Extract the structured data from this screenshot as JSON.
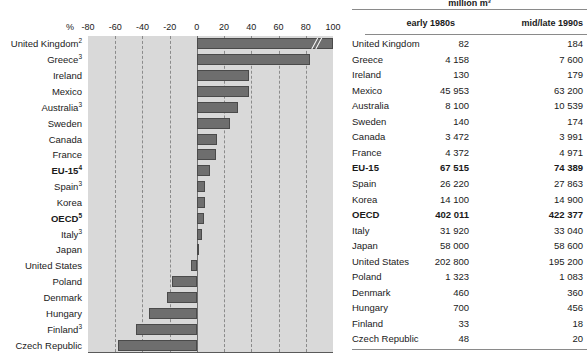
{
  "chart_data": {
    "type": "bar",
    "orientation": "horizontal",
    "title": "",
    "xlabel": "%",
    "ylabel": "",
    "xlim": [
      -80,
      100
    ],
    "grid": true,
    "legend": "none",
    "unit_label": "%",
    "tick_labels": [
      "-80",
      "-60",
      "-40",
      "-20",
      "0",
      "20",
      "40",
      "60",
      "80",
      "100"
    ],
    "ticks": [
      -80,
      -60,
      -40,
      -20,
      0,
      20,
      40,
      60,
      80,
      100
    ],
    "categories": [
      "United Kingdom",
      "Greece",
      "Ireland",
      "Mexico",
      "Australia",
      "Sweden",
      "Canada",
      "France",
      "EU-15",
      "Spain",
      "Korea",
      "OECD",
      "Italy",
      "Japan",
      "United States",
      "Poland",
      "Denmark",
      "Hungary",
      "Finland",
      "Czech Republic"
    ],
    "category_footnotes": [
      "2",
      "3",
      "",
      "",
      "3",
      "",
      "",
      "",
      "4",
      "3",
      "",
      "5",
      "3",
      "",
      "",
      "",
      "",
      "",
      "3",
      ""
    ],
    "category_bold": [
      false,
      false,
      false,
      false,
      false,
      false,
      false,
      false,
      true,
      false,
      false,
      true,
      false,
      false,
      false,
      false,
      false,
      false,
      false,
      false
    ],
    "values": [
      124,
      83,
      38,
      38,
      30,
      24,
      15,
      14,
      10,
      6,
      6,
      5,
      4,
      1,
      -4,
      -18,
      -22,
      -35,
      -45,
      -58
    ],
    "value_truncated": [
      true,
      false,
      false,
      false,
      false,
      false,
      false,
      false,
      false,
      false,
      false,
      false,
      false,
      false,
      false,
      false,
      false,
      false,
      false,
      false
    ]
  },
  "chart": {
    "axis_unit": "%"
  },
  "table": {
    "unit_header": "million m³",
    "columns": [
      "early 1980s",
      "mid/late 1990s"
    ],
    "rows": [
      {
        "name": "United Kingdom",
        "early": "82",
        "late": "184",
        "bold": false
      },
      {
        "name": "Greece",
        "early": "4 158",
        "late": "7 600",
        "bold": false
      },
      {
        "name": "Ireland",
        "early": "130",
        "late": "179",
        "bold": false
      },
      {
        "name": "Mexico",
        "early": "45 953",
        "late": "63 200",
        "bold": false
      },
      {
        "name": "Australia",
        "early": "8 100",
        "late": "10 539",
        "bold": false
      },
      {
        "name": "Sweden",
        "early": "140",
        "late": "174",
        "bold": false
      },
      {
        "name": "Canada",
        "early": "3 472",
        "late": "3 991",
        "bold": false
      },
      {
        "name": "France",
        "early": "4 372",
        "late": "4 971",
        "bold": false
      },
      {
        "name": "EU-15",
        "early": "67 515",
        "late": "74 389",
        "bold": true
      },
      {
        "name": "Spain",
        "early": "26 220",
        "late": "27 863",
        "bold": false
      },
      {
        "name": "Korea",
        "early": "14 100",
        "late": "14 900",
        "bold": false
      },
      {
        "name": "OECD",
        "early": "402 011",
        "late": "422 377",
        "bold": true
      },
      {
        "name": "Italy",
        "early": "31 920",
        "late": "33 040",
        "bold": false
      },
      {
        "name": "Japan",
        "early": "58 000",
        "late": "58 600",
        "bold": false
      },
      {
        "name": "United States",
        "early": "202 800",
        "late": "195 200",
        "bold": false
      },
      {
        "name": "Poland",
        "early": "1 323",
        "late": "1 083",
        "bold": false
      },
      {
        "name": "Denmark",
        "early": "460",
        "late": "360",
        "bold": false
      },
      {
        "name": "Hungary",
        "early": "700",
        "late": "456",
        "bold": false
      },
      {
        "name": "Finland",
        "early": "33",
        "late": "18",
        "bold": false
      },
      {
        "name": "Czech Republic",
        "early": "48",
        "late": "20",
        "bold": false
      }
    ]
  }
}
